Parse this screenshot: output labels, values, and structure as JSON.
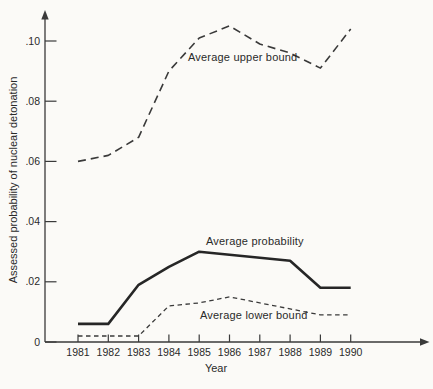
{
  "figure": {
    "background_color": "#fbfaf7",
    "line_color": "#3a3a3a",
    "bold_line_color": "#262626",
    "text_color": "#2a2a2a"
  },
  "chart_data": {
    "type": "line",
    "title": "",
    "xlabel": "Year",
    "ylabel": "Assessed probability of nuclear detonation",
    "x": [
      1981,
      1982,
      1983,
      1984,
      1985,
      1986,
      1987,
      1988,
      1989,
      1990
    ],
    "x_tick_labels": [
      "1981",
      "1982",
      "1983",
      "1984",
      "1985",
      "1986",
      "1987",
      "1988",
      "1989",
      "1990"
    ],
    "ylim": [
      0,
      0.112
    ],
    "y_ticks": [
      0,
      0.02,
      0.04,
      0.06,
      0.08,
      0.1
    ],
    "y_tick_labels": [
      "0",
      ".02",
      ".04",
      ".06",
      ".08",
      ".10"
    ],
    "grid": false,
    "legend_position": "inline-annotations",
    "axis_arrows": [
      "y-top",
      "x-right"
    ],
    "series": [
      {
        "name": "Average upper bound",
        "style": "dashed",
        "values": [
          0.06,
          0.062,
          0.068,
          0.09,
          0.101,
          0.105,
          0.099,
          0.096,
          0.091,
          0.104
        ]
      },
      {
        "name": "Average probability",
        "style": "solid-bold",
        "values": [
          0.006,
          0.006,
          0.019,
          0.025,
          0.03,
          0.029,
          0.028,
          0.027,
          0.018,
          0.018
        ]
      },
      {
        "name": "Average lower bound",
        "style": "dashed-thin",
        "values": [
          0.002,
          0.002,
          0.002,
          0.012,
          0.013,
          0.015,
          0.013,
          0.011,
          0.009,
          0.009
        ]
      }
    ]
  }
}
